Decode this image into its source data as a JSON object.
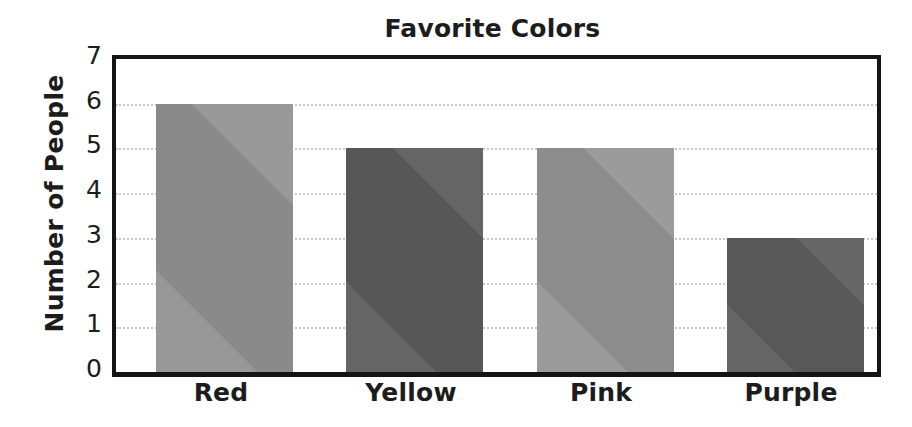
{
  "chart_data": {
    "type": "bar",
    "title": "Favorite Colors",
    "xlabel": "",
    "ylabel": "Number of People",
    "categories": [
      "Red",
      "Yellow",
      "Pink",
      "Purple"
    ],
    "values": [
      6,
      5,
      5,
      3
    ],
    "ylim": [
      0,
      7
    ],
    "ytick_labels": [
      "7",
      "6",
      "5",
      "4",
      "3",
      "2",
      "1",
      "0"
    ],
    "ytick_values": [
      7,
      6,
      5,
      4,
      3,
      2,
      1,
      0
    ],
    "ytick_step": 1,
    "grid": true,
    "grid_orientation": "horizontal",
    "grid_color": "#c9c9c9",
    "legend": false,
    "legend_position": "none",
    "plot_background": "#ffffff",
    "frame_color": "#141414",
    "text_color": "#1c1c1c",
    "bar_colors": [
      "#8a8a8a",
      "#575757",
      "#8d8d8d",
      "#585858"
    ],
    "bars": [
      {
        "category": "Red",
        "value": 6,
        "color": "#8a8a8a"
      },
      {
        "category": "Yellow",
        "value": 5,
        "color": "#575757"
      },
      {
        "category": "Pink",
        "value": 5,
        "color": "#8d8d8d"
      },
      {
        "category": "Purple",
        "value": 3,
        "color": "#585858"
      }
    ]
  }
}
